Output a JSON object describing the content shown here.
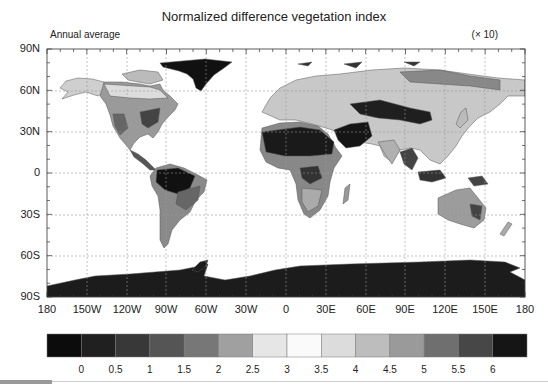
{
  "header": {
    "title": "Normalized difference vegetation index",
    "subtitle": "Annual average",
    "scale_note": "(× 10)"
  },
  "axes": {
    "y_ticks": [
      {
        "label": "90N",
        "y": 49
      },
      {
        "label": "60N",
        "y": 91
      },
      {
        "label": "30N",
        "y": 132
      },
      {
        "label": "0",
        "y": 173
      },
      {
        "label": "30S",
        "y": 215
      },
      {
        "label": "60S",
        "y": 256
      },
      {
        "label": "90S",
        "y": 297
      }
    ],
    "x_ticks": [
      {
        "label": "180",
        "x": 47
      },
      {
        "label": "150W",
        "x": 87
      },
      {
        "label": "120W",
        "x": 127
      },
      {
        "label": "90W",
        "x": 166
      },
      {
        "label": "60W",
        "x": 206
      },
      {
        "label": "30W",
        "x": 246
      },
      {
        "label": "0",
        "x": 286
      },
      {
        "label": "30E",
        "x": 326
      },
      {
        "label": "60E",
        "x": 366
      },
      {
        "label": "90E",
        "x": 405
      },
      {
        "label": "120E",
        "x": 445
      },
      {
        "label": "150E",
        "x": 485
      },
      {
        "label": "180",
        "x": 525
      }
    ]
  },
  "colorbar": {
    "colors": [
      "#0c0c0c",
      "#202020",
      "#383838",
      "#555555",
      "#777777",
      "#a0a0a0",
      "#e6e6e6",
      "#fafafa",
      "#dcdcdc",
      "#bdbdbd",
      "#9a9a9a",
      "#6f6f6f",
      "#474747",
      "#151515"
    ],
    "labels": [
      "0",
      "0.5",
      "1",
      "1.5",
      "2",
      "2.5",
      "3",
      "3.5",
      "4",
      "4.5",
      "5",
      "5.5",
      "6"
    ]
  },
  "chart_data": {
    "type": "heatmap",
    "title": "Normalized difference vegetation index",
    "subtitle": "Annual average",
    "units_note": "(× 10)",
    "projection": "equirectangular (cylindrical equidistant)",
    "lon_range": [
      -180,
      180
    ],
    "lat_range": [
      -90,
      90
    ],
    "xlabel_ticks": [
      "180",
      "150W",
      "120W",
      "90W",
      "60W",
      "30W",
      "0",
      "30E",
      "60E",
      "90E",
      "120E",
      "150E",
      "180"
    ],
    "ylabel_ticks": [
      "90N",
      "60N",
      "30N",
      "0",
      "30S",
      "60S",
      "90S"
    ],
    "grid": true,
    "colorbar_levels": [
      0,
      0.5,
      1,
      1.5,
      2,
      2.5,
      3,
      3.5,
      4,
      4.5,
      5,
      5.5,
      6
    ],
    "colorbar_position": "bottom"
  }
}
